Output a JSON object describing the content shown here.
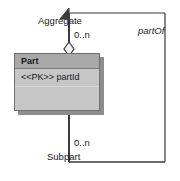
{
  "diagram": {
    "type": "uml-class-diagram",
    "background_color": "#ffffff",
    "line_color": "#3a3a3a",
    "classes": [
      {
        "name": "Part",
        "header_color": "#a8a8a8",
        "body_color": "#c6c6c6",
        "border_color": "#6f6f6f",
        "shadow_color": "#8d8d8d",
        "attributes": [
          {
            "stereotype": "<<PK>>",
            "name": "partId",
            "text": "<<PK>> partId"
          }
        ],
        "operations": []
      }
    ],
    "associations": [
      {
        "name": "partOf",
        "kind": "aggregation",
        "self_referencing": true,
        "source_role": {
          "label": "Aggregate",
          "multiplicity": "0..n",
          "end_decoration": "hollow-diamond"
        },
        "target_role": {
          "label": "Subpart",
          "multiplicity": "0..n",
          "end_decoration": "filled-arrow"
        }
      }
    ],
    "labels": {
      "aggregate": "Aggregate",
      "multiplicity_top": "0..n",
      "subpart": "Subpart",
      "multiplicity_bottom": "0..n",
      "association_name": "partOf",
      "class_name": "Part",
      "class_attribute": "<<PK>> partId"
    }
  }
}
